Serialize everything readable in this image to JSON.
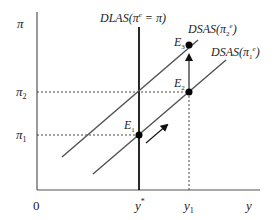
{
  "diagram": {
    "type": "economics-dlas-dsas",
    "axes": {
      "y_label": "π",
      "x_label": "y",
      "origin_label": "0"
    },
    "y_ticks": [
      {
        "label": "π",
        "sub": "2",
        "y": 92
      },
      {
        "label": "π",
        "sub": "1",
        "y": 135
      }
    ],
    "x_ticks": [
      {
        "label": "y",
        "sup": "*",
        "x": 139
      },
      {
        "label": "y",
        "sub": "1",
        "x": 189
      }
    ],
    "curves": {
      "dlas": {
        "label_main": "DLAS(π",
        "label_sup": "e",
        "label_tail": " = π)"
      },
      "dsas2": {
        "label_main": "DSAS(π",
        "label_sub": "2",
        "label_sup": "e",
        "label_tail": ")"
      },
      "dsas1": {
        "label_main": "DSAS(π",
        "label_sub": "1",
        "label_sup": "e",
        "label_tail": ")"
      }
    },
    "points": [
      {
        "name": "E",
        "sub": "1"
      },
      {
        "name": "E",
        "sub": "2"
      },
      {
        "name": "E",
        "sub": "3"
      }
    ],
    "colors": {
      "line": "#555555",
      "axis": "#444444",
      "dlas": "#111111",
      "point": "#000000"
    }
  }
}
